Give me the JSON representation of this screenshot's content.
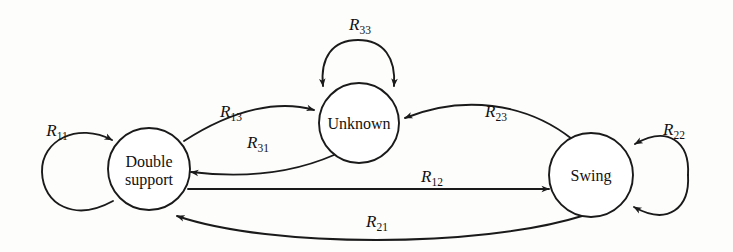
{
  "diagram": {
    "type": "state-transition-diagram",
    "title": "",
    "background_color": "#fdfdfc",
    "stroke_color": "#1a1a1a",
    "node_fill": "#ffffff",
    "nodes": [
      {
        "id": "double-support",
        "label": "Double support",
        "label_lines": [
          "Double",
          "support"
        ],
        "cx": 149,
        "cy": 169,
        "r": 41
      },
      {
        "id": "unknown",
        "label": "Unknown",
        "label_lines": [
          "Unknown"
        ],
        "cx": 359,
        "cy": 123,
        "r": 40
      },
      {
        "id": "swing",
        "label": "Swing",
        "label_lines": [
          "Swing"
        ],
        "cx": 591,
        "cy": 175,
        "r": 42
      }
    ],
    "edges": [
      {
        "id": "r11",
        "label": "R",
        "subscript": "11",
        "full_label": "R11",
        "from": "double-support",
        "to": "double-support",
        "kind": "self-loop",
        "label_x": 57,
        "label_y": 136
      },
      {
        "id": "r33",
        "label": "R",
        "subscript": "33",
        "full_label": "R33",
        "from": "unknown",
        "to": "unknown",
        "kind": "self-loop",
        "label_x": 360,
        "label_y": 30
      },
      {
        "id": "r22",
        "label": "R",
        "subscript": "22",
        "full_label": "R22",
        "from": "swing",
        "to": "swing",
        "kind": "self-loop",
        "label_x": 674,
        "label_y": 135
      },
      {
        "id": "r13",
        "label": "R",
        "subscript": "13",
        "full_label": "R13",
        "from": "double-support",
        "to": "unknown",
        "kind": "curve",
        "label_x": 231,
        "label_y": 117
      },
      {
        "id": "r31",
        "label": "R",
        "subscript": "31",
        "full_label": "R31",
        "from": "unknown",
        "to": "double-support",
        "kind": "curve",
        "label_x": 258,
        "label_y": 148
      },
      {
        "id": "r23",
        "label": "R",
        "subscript": "23",
        "full_label": "R23",
        "from": "swing",
        "to": "unknown",
        "kind": "curve",
        "label_x": 496,
        "label_y": 117
      },
      {
        "id": "r12",
        "label": "R",
        "subscript": "12",
        "full_label": "R12",
        "from": "double-support",
        "to": "swing",
        "kind": "straight",
        "label_x": 432,
        "label_y": 182
      },
      {
        "id": "r21",
        "label": "R",
        "subscript": "21",
        "full_label": "R21",
        "from": "swing",
        "to": "double-support",
        "kind": "curve",
        "label_x": 377,
        "label_y": 227
      }
    ]
  }
}
